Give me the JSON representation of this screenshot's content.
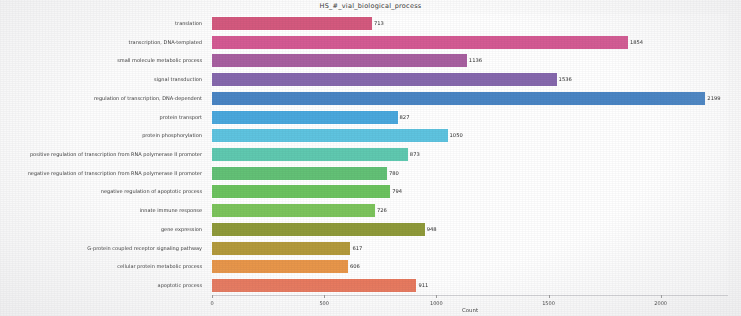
{
  "chart_data": {
    "type": "bar",
    "orientation": "horizontal",
    "title": "HS_#_vial_biological_process",
    "xlabel": "Count",
    "ylabel": "Function",
    "xlim": [
      0,
      2300
    ],
    "xticks": [
      0,
      500,
      1000,
      1500,
      2000
    ],
    "xticklabels": [
      "0",
      "500",
      "1000",
      "1500",
      "2000"
    ],
    "grid": false,
    "legend": "none",
    "categories": [
      "translation",
      "transcription, DNA-templated",
      "small molecule metabolic process",
      "signal transduction",
      "regulation of transcription, DNA-dependent",
      "protein transport",
      "protein phosphorylation",
      "positive regulation of transcription from RNA polymerase II promoter",
      "negative regulation of transcription from RNA polymerase II promoter",
      "negative regulation of apoptotic process",
      "innate immune response",
      "gene expression",
      "G-protein coupled receptor signaling pathway",
      "cellular protein metabolic process",
      "apoptotic process"
    ],
    "values": [
      713,
      1854,
      1136,
      1536,
      2199,
      827,
      1050,
      873,
      780,
      794,
      726,
      948,
      617,
      606,
      911
    ],
    "bar_labels": [
      "713",
      "1854",
      "1136",
      "1536",
      "2199",
      "827",
      "1050",
      "873",
      "780",
      "794",
      "726",
      "948",
      "617",
      "606",
      "911"
    ],
    "colors": [
      "#d4597e",
      "#d45a93",
      "#a85fa0",
      "#8668ad",
      "#4a85c4",
      "#4aa8dd",
      "#5ec4e0",
      "#5fc9b0",
      "#63c176",
      "#6cc35f",
      "#7cc45c",
      "#8f9a3a",
      "#b39a3c",
      "#e8964a",
      "#e8795e"
    ]
  }
}
